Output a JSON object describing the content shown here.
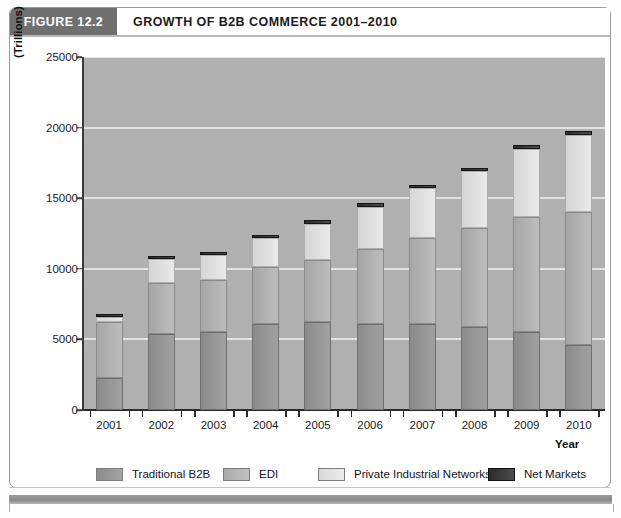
{
  "figure": {
    "tag": "FIGURE 12.2",
    "title": "GROWTH OF B2B COMMERCE 2001–2010"
  },
  "colors": {
    "traditional_b2b": "#949494",
    "edi": "#b4b4b4",
    "private_industrial_networks": "#e0e0e0",
    "net_markets": "#303030",
    "plot_background": "#b0b0b0",
    "gridline": "#e2e2e2",
    "tag_background": "#6f6f6f"
  },
  "chart_data": {
    "type": "bar",
    "stacked": true,
    "title": "GROWTH OF B2B COMMERCE 2001–2010",
    "xlabel": "Year",
    "ylabel": "(Trillions)",
    "ylim": [
      0,
      25000
    ],
    "yticks": [
      0,
      5000,
      10000,
      15000,
      20000,
      25000
    ],
    "ytick_labels": [
      "0",
      "5000",
      "10000",
      "15000",
      "20000",
      "25000"
    ],
    "grid": true,
    "legend_position": "bottom",
    "categories": [
      "2001",
      "2002",
      "2003",
      "2004",
      "2005",
      "2006",
      "2007",
      "2008",
      "2009",
      "2010"
    ],
    "series": [
      {
        "name": "Traditional B2B",
        "color": "#949494",
        "values": [
          2300,
          5400,
          5500,
          6100,
          6200,
          6100,
          6100,
          5900,
          5500,
          4600
        ]
      },
      {
        "name": "EDI",
        "color": "#b4b4b4",
        "values": [
          3900,
          3600,
          3700,
          4000,
          4400,
          5300,
          6100,
          7000,
          8200,
          9400
        ]
      },
      {
        "name": "Private Industrial Networks",
        "color": "#e0e0e0",
        "values": [
          400,
          1700,
          1800,
          2100,
          2600,
          3000,
          3500,
          4000,
          4800,
          5500
        ]
      },
      {
        "name": "Net Markets",
        "color": "#303030",
        "values": [
          150,
          200,
          200,
          200,
          250,
          250,
          250,
          250,
          250,
          250
        ]
      }
    ],
    "stack_tops": {
      "2001": [
        2300,
        6200,
        6600,
        6750
      ],
      "2002": [
        5400,
        9000,
        10700,
        10900
      ],
      "2003": [
        5500,
        9200,
        11000,
        11200
      ],
      "2004": [
        6100,
        10100,
        12200,
        12400
      ],
      "2005": [
        6200,
        10600,
        13200,
        13450
      ],
      "2006": [
        6100,
        11400,
        14400,
        14650
      ],
      "2007": [
        6100,
        12200,
        15700,
        15950
      ],
      "2008": [
        5900,
        12900,
        16900,
        17150
      ],
      "2009": [
        5500,
        13700,
        18500,
        18750
      ],
      "2010": [
        4600,
        14000,
        19500,
        19750
      ]
    }
  },
  "legend": {
    "items": [
      {
        "label": "Traditional B2B"
      },
      {
        "label": "EDI"
      },
      {
        "label": "Private Industrial Networks"
      },
      {
        "label": "Net Markets"
      }
    ]
  }
}
